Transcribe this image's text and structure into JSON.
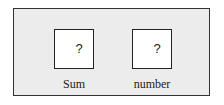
{
  "diagram": {
    "boxes": [
      {
        "value": "?",
        "label": "Sum"
      },
      {
        "value": "?",
        "label": "number"
      }
    ]
  }
}
